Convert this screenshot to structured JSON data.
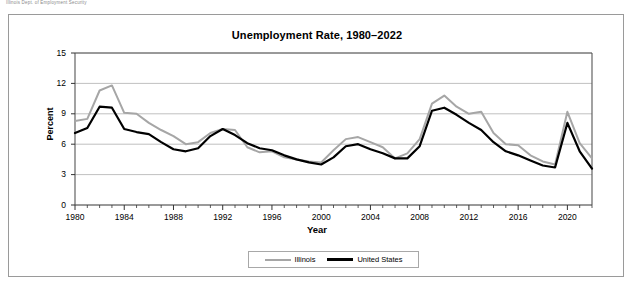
{
  "top_note": "Illinois Dept. of Employment Security",
  "figure": {
    "title": "Unemployment Rate, 1980–2022",
    "xlabel": "Year",
    "ylabel": "Percent"
  },
  "legend": {
    "position": "bottom-center",
    "entries": [
      {
        "label": "Illinois",
        "color": "#a6a6a6",
        "swatch": "line-swatch-illinois"
      },
      {
        "label": "United States",
        "color": "#000000",
        "swatch": "line-swatch-united-states"
      }
    ]
  },
  "axes": {
    "y_ticks": [
      "0",
      "3",
      "6",
      "9",
      "12",
      "15"
    ],
    "x_ticks": [
      "1980",
      "1984",
      "1988",
      "1992",
      "1996",
      "2000",
      "2004",
      "2008",
      "2012",
      "2016",
      "2020"
    ],
    "ylim": [
      0,
      15
    ],
    "xlim": [
      1980,
      2022
    ],
    "grid": "horizontal"
  },
  "chart_data": {
    "type": "line",
    "title": "Unemployment Rate, 1980–2022",
    "xlabel": "Year",
    "ylabel": "Percent",
    "ylim": [
      0,
      15
    ],
    "xlim": [
      1980,
      2022
    ],
    "grid": true,
    "legend_position": "bottom-center",
    "x": [
      1980,
      1981,
      1982,
      1983,
      1984,
      1985,
      1986,
      1987,
      1988,
      1989,
      1990,
      1991,
      1992,
      1993,
      1994,
      1995,
      1996,
      1997,
      1998,
      1999,
      2000,
      2001,
      2002,
      2003,
      2004,
      2005,
      2006,
      2007,
      2008,
      2009,
      2010,
      2011,
      2012,
      2013,
      2014,
      2015,
      2016,
      2017,
      2018,
      2019,
      2020,
      2021,
      2022
    ],
    "series": [
      {
        "name": "Illinois",
        "color": "#a6a6a6",
        "values": [
          8.3,
          8.5,
          11.3,
          11.8,
          9.1,
          9.0,
          8.1,
          7.4,
          6.8,
          6.0,
          6.2,
          7.1,
          7.5,
          7.4,
          5.7,
          5.2,
          5.3,
          4.7,
          4.5,
          4.3,
          4.2,
          5.4,
          6.5,
          6.7,
          6.2,
          5.7,
          4.6,
          5.1,
          6.5,
          10.0,
          10.8,
          9.7,
          9.0,
          9.2,
          7.1,
          6.0,
          5.9,
          4.9,
          4.3,
          4.0,
          9.2,
          6.1,
          4.6
        ]
      },
      {
        "name": "United States",
        "color": "#000000",
        "values": [
          7.1,
          7.6,
          9.7,
          9.6,
          7.5,
          7.2,
          7.0,
          6.2,
          5.5,
          5.3,
          5.6,
          6.8,
          7.5,
          6.9,
          6.1,
          5.6,
          5.4,
          4.9,
          4.5,
          4.2,
          4.0,
          4.7,
          5.8,
          6.0,
          5.5,
          5.1,
          4.6,
          4.6,
          5.8,
          9.3,
          9.6,
          8.9,
          8.1,
          7.4,
          6.2,
          5.3,
          4.9,
          4.4,
          3.9,
          3.7,
          8.1,
          5.3,
          3.6
        ]
      }
    ]
  }
}
